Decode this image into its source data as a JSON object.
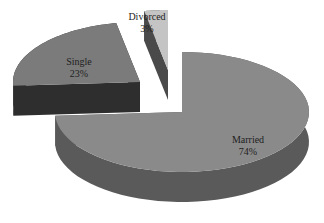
{
  "chart_data": {
    "type": "pie",
    "style": "3d-exploded",
    "title": "",
    "categories": [
      "Married",
      "Single",
      "Divorced"
    ],
    "values": [
      74,
      23,
      3
    ],
    "labels": [
      {
        "name": "Married",
        "value": "74%"
      },
      {
        "name": "Single",
        "value": "23%"
      },
      {
        "name": "Divorced",
        "value": "3%"
      }
    ],
    "colors": {
      "Married": {
        "top": "#8a8a8a",
        "side": "#5a5a5a"
      },
      "Single": {
        "top": "#7b7b7b",
        "side": "#2e2e2e"
      },
      "Divorced": {
        "top": "#c4c4c4",
        "side": "#4a4a4a"
      }
    },
    "legend": "none",
    "start_angle_deg": 0,
    "direction": "clockwise"
  }
}
